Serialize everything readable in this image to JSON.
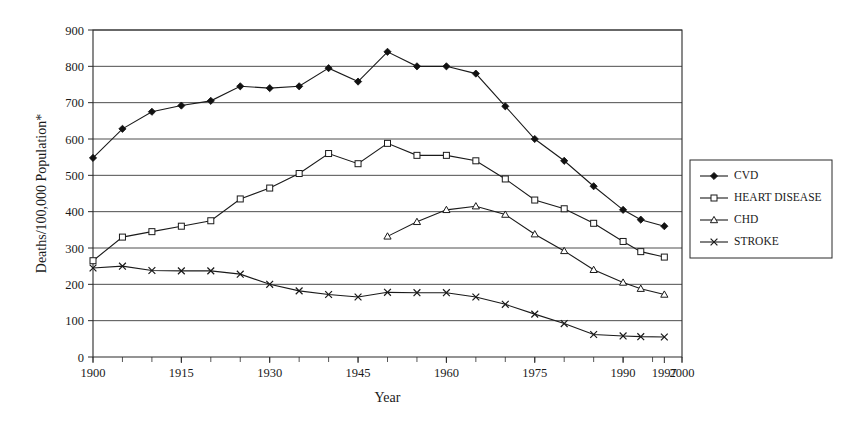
{
  "chart_data": {
    "type": "line",
    "title": "",
    "xlabel": "Year",
    "ylabel": "Deaths/100,000 Population*",
    "xlim": [
      1900,
      2000
    ],
    "ylim": [
      0,
      900
    ],
    "grid": true,
    "legend_position": "right",
    "x_ticks": [
      1900,
      1915,
      1930,
      1945,
      1960,
      1975,
      1990,
      1997,
      2000
    ],
    "x_tick_labels": [
      "1900",
      "1915",
      "1930",
      "1945",
      "1960",
      "1975",
      "1990",
      "1997",
      "2000"
    ],
    "x_minor_tick_step": 5,
    "y_ticks": [
      0,
      100,
      200,
      300,
      400,
      500,
      600,
      700,
      800,
      900
    ],
    "y_tick_labels": [
      "0",
      "100",
      "200",
      "300",
      "400",
      "500",
      "600",
      "700",
      "800",
      "900"
    ],
    "series": [
      {
        "name": "CVD",
        "marker": "filled-diamond",
        "color": "#111111",
        "x": [
          1900,
          1905,
          1910,
          1915,
          1920,
          1925,
          1930,
          1935,
          1940,
          1945,
          1950,
          1955,
          1960,
          1965,
          1970,
          1975,
          1980,
          1985,
          1990,
          1993,
          1997
        ],
        "values": [
          548,
          628,
          675,
          692,
          705,
          745,
          740,
          745,
          795,
          758,
          840,
          800,
          800,
          780,
          690,
          600,
          540,
          470,
          405,
          378,
          360
        ]
      },
      {
        "name": "HEART DISEASE",
        "marker": "open-square",
        "color": "#1a1a1a",
        "x": [
          1900,
          1905,
          1910,
          1915,
          1920,
          1925,
          1930,
          1935,
          1940,
          1945,
          1950,
          1955,
          1960,
          1965,
          1970,
          1975,
          1980,
          1985,
          1990,
          1993,
          1997
        ],
        "values": [
          265,
          330,
          345,
          360,
          375,
          435,
          465,
          505,
          560,
          532,
          588,
          555,
          555,
          540,
          490,
          432,
          408,
          368,
          318,
          290,
          275
        ]
      },
      {
        "name": "CHD",
        "marker": "open-triangle",
        "color": "#1a1a1a",
        "x": [
          1950,
          1955,
          1960,
          1965,
          1970,
          1975,
          1980,
          1985,
          1990,
          1993,
          1997
        ],
        "values": [
          332,
          372,
          405,
          415,
          392,
          338,
          292,
          240,
          205,
          188,
          172
        ]
      },
      {
        "name": "STROKE",
        "marker": "x",
        "color": "#1a1a1a",
        "x": [
          1900,
          1905,
          1910,
          1915,
          1920,
          1925,
          1930,
          1935,
          1940,
          1945,
          1950,
          1955,
          1960,
          1965,
          1970,
          1975,
          1980,
          1985,
          1990,
          1993,
          1997
        ],
        "values": [
          245,
          250,
          238,
          237,
          237,
          228,
          200,
          182,
          172,
          165,
          178,
          177,
          177,
          165,
          145,
          118,
          92,
          62,
          58,
          56,
          55
        ]
      }
    ]
  },
  "legend": {
    "items": [
      {
        "label": "CVD",
        "marker": "filled-diamond"
      },
      {
        "label": "HEART DISEASE",
        "marker": "open-square"
      },
      {
        "label": "CHD",
        "marker": "open-triangle"
      },
      {
        "label": "STROKE",
        "marker": "x"
      }
    ]
  }
}
